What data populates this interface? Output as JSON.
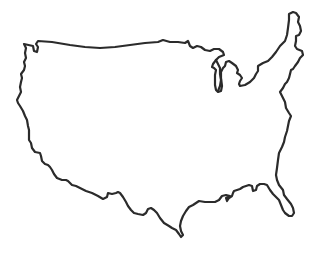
{
  "map": {
    "title": "United States outline",
    "style": "hand-drawn line outline",
    "stroke_color": "#2b2b2b",
    "background_color": "#ffffff",
    "regions": [
      {
        "name": "contiguous-united-states",
        "label": "Contiguous United States"
      },
      {
        "name": "lake-michigan",
        "label": "Lake Michigan"
      }
    ]
  }
}
